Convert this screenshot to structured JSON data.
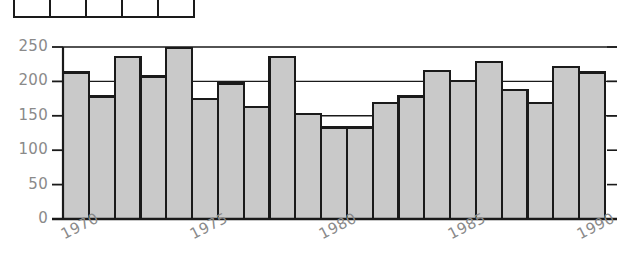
{
  "table_fragment": {
    "name": "cropped-table-fragment",
    "columns": 5,
    "cells": [
      "",
      "",
      "",
      "",
      ""
    ]
  },
  "chart_data": {
    "type": "bar",
    "title": "",
    "subtitle": "",
    "xlabel": "",
    "ylabel": "",
    "categories": [
      "1970",
      "1971",
      "1972",
      "1973",
      "1974",
      "1975",
      "1976",
      "1977",
      "1978",
      "1979",
      "1980",
      "1981",
      "1982",
      "1983",
      "1984",
      "1985",
      "1986",
      "1987",
      "1988",
      "1989",
      "1990"
    ],
    "values": [
      213,
      178,
      236,
      207,
      249,
      174,
      197,
      163,
      236,
      153,
      133,
      133,
      169,
      178,
      215,
      201,
      228,
      188,
      169,
      221,
      213
    ],
    "ylim": [
      0,
      250
    ],
    "xlim": [
      "1970",
      "1990"
    ],
    "ytick_values": [
      0,
      50,
      100,
      150,
      200,
      250
    ],
    "ytick_labels": [
      "0",
      "50",
      "100",
      "150",
      "200",
      "250"
    ],
    "xtick_labels": [
      "1970",
      "1975",
      "1980",
      "1985",
      "1990"
    ],
    "xtick_categories": [
      "1970",
      "1975",
      "1980",
      "1985",
      "1990"
    ],
    "grid": true,
    "gridlines_at": [
      150,
      200,
      250
    ],
    "legend": null,
    "legend_position": "none",
    "bar_fill_color": "#c9c9c9",
    "bar_edge_color": "#1a1a1a",
    "axis_color": "#1a1a1a",
    "tick_label_color": "#8a8a8a",
    "background_color": "#ffffff"
  }
}
